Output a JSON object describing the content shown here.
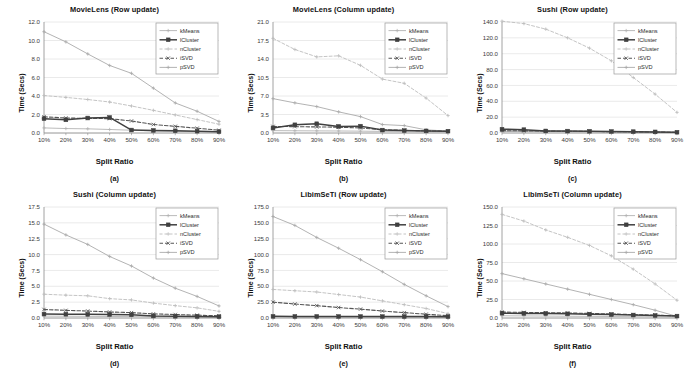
{
  "figure": {
    "ylabel": "Time (Secs)",
    "xlabel": "Split Ratio",
    "categories": [
      "10%",
      "20%",
      "30%",
      "40%",
      "50%",
      "60%",
      "70%",
      "80%",
      "90%"
    ],
    "series_names": [
      "kMeans",
      "lCluster",
      "nCluster",
      "iSVD",
      "pSVD"
    ],
    "colors": {
      "kMeans": "#b3b3b3",
      "lCluster": "#404040",
      "nCluster": "#bdbdbd",
      "iSVD": "#555555",
      "pSVD": "#aaaaaa",
      "grid": "#d9d9d9",
      "axis": "#8c8c8c"
    }
  },
  "chart_data": [
    {
      "type": "line",
      "panel": "a",
      "title": "MovieLens (Row update)",
      "caption": "(a)",
      "xlabel": "Split Ratio",
      "ylabel": "Time (Secs)",
      "categories": [
        "10%",
        "20%",
        "30%",
        "40%",
        "50%",
        "60%",
        "70%",
        "80%",
        "90%"
      ],
      "yticks": [
        0.0,
        2.0,
        4.0,
        6.0,
        8.0,
        10.0,
        12.0
      ],
      "ytick_labels": [
        "0.0",
        "2.0",
        "4.0",
        "6.0",
        "8.0",
        "10.0",
        "12.0"
      ],
      "ylim": [
        0.0,
        12.0
      ],
      "grid": true,
      "legend_position": "top-right",
      "series": [
        {
          "name": "kMeans",
          "values": [
            0.55,
            0.48,
            0.45,
            0.38,
            0.3,
            0.22,
            0.18,
            0.14,
            0.1
          ]
        },
        {
          "name": "lCluster",
          "values": [
            1.55,
            1.42,
            1.62,
            1.68,
            0.32,
            0.28,
            0.24,
            0.2,
            0.14
          ]
        },
        {
          "name": "nCluster",
          "values": [
            4.05,
            3.85,
            3.62,
            3.35,
            2.92,
            2.45,
            1.95,
            1.45,
            0.95
          ]
        },
        {
          "name": "iSVD",
          "values": [
            1.75,
            1.62,
            1.58,
            1.55,
            1.3,
            0.92,
            0.72,
            0.52,
            0.3
          ]
        },
        {
          "name": "pSVD",
          "values": [
            10.95,
            9.85,
            8.55,
            7.3,
            6.45,
            4.85,
            3.25,
            2.35,
            1.25
          ]
        }
      ]
    },
    {
      "type": "line",
      "panel": "b",
      "title": "MovieLens (Column update)",
      "caption": "(b)",
      "xlabel": "Split Ratio",
      "ylabel": "Time (Secs)",
      "categories": [
        "10%",
        "20%",
        "30%",
        "40%",
        "50%",
        "60%",
        "70%",
        "80%",
        "90%"
      ],
      "yticks": [
        0.0,
        3.5,
        7.0,
        10.5,
        14.0,
        17.5,
        21.0
      ],
      "ytick_labels": [
        "0.0",
        "3.5",
        "7.0",
        "10.5",
        "14.0",
        "17.5",
        "21.0"
      ],
      "ylim": [
        0.0,
        21.0
      ],
      "grid": true,
      "legend_position": "top-right",
      "series": [
        {
          "name": "kMeans",
          "values": [
            0.45,
            0.42,
            0.4,
            0.38,
            0.35,
            0.3,
            0.26,
            0.2,
            0.15
          ]
        },
        {
          "name": "lCluster",
          "values": [
            0.95,
            1.55,
            1.75,
            1.25,
            1.3,
            0.55,
            0.45,
            0.4,
            0.35
          ]
        },
        {
          "name": "nCluster",
          "values": [
            17.9,
            15.8,
            14.4,
            14.6,
            12.8,
            10.2,
            9.4,
            6.6,
            3.3
          ]
        },
        {
          "name": "iSVD",
          "values": [
            1.25,
            1.2,
            1.15,
            1.1,
            0.95,
            0.62,
            0.5,
            0.42,
            0.32
          ]
        },
        {
          "name": "pSVD",
          "values": [
            6.5,
            5.7,
            5.0,
            4.0,
            3.1,
            1.6,
            1.4,
            0.6,
            0.35
          ]
        }
      ]
    },
    {
      "type": "line",
      "panel": "c",
      "title": "Sushi (Row update)",
      "caption": "(c)",
      "xlabel": "Split Ratio",
      "ylabel": "Time (Secs)",
      "categories": [
        "10%",
        "20%",
        "30%",
        "40%",
        "50%",
        "60%",
        "70%",
        "80%",
        "90%"
      ],
      "yticks": [
        0.0,
        20.0,
        40.0,
        60.0,
        80.0,
        100.0,
        120.0,
        140.0
      ],
      "ytick_labels": [
        "0.0",
        "20.0",
        "40.0",
        "60.0",
        "80.0",
        "100.0",
        "120.0",
        "140.0"
      ],
      "ylim": [
        0.0,
        140.0
      ],
      "grid": true,
      "legend_position": "top-right",
      "series": [
        {
          "name": "kMeans",
          "values": [
            2.0,
            1.8,
            1.6,
            1.4,
            1.2,
            1.0,
            0.9,
            0.7,
            0.5
          ]
        },
        {
          "name": "lCluster",
          "values": [
            4.8,
            4.2,
            2.6,
            2.4,
            2.2,
            1.9,
            1.7,
            1.4,
            1.0
          ]
        },
        {
          "name": "nCluster",
          "values": [
            141.0,
            138.0,
            131.0,
            120.0,
            107.0,
            91.0,
            70.0,
            49.0,
            26.0
          ]
        },
        {
          "name": "iSVD",
          "values": [
            3.0,
            2.7,
            2.4,
            2.2,
            2.0,
            1.7,
            1.5,
            1.2,
            0.9
          ]
        },
        {
          "name": "pSVD",
          "values": [
            2.5,
            2.2,
            2.0,
            1.8,
            1.6,
            1.4,
            1.2,
            1.0,
            0.7
          ]
        }
      ]
    },
    {
      "type": "line",
      "panel": "d",
      "title": "Sushi (Column update)",
      "caption": "(d)",
      "xlabel": "Split Ratio",
      "ylabel": "Time (Secs)",
      "categories": [
        "10%",
        "20%",
        "30%",
        "40%",
        "50%",
        "60%",
        "70%",
        "80%",
        "90%"
      ],
      "yticks": [
        0.0,
        2.5,
        5.0,
        7.5,
        10.0,
        12.5,
        15.0,
        17.5
      ],
      "ytick_labels": [
        "0.0",
        "2.5",
        "5.0",
        "7.5",
        "10.0",
        "12.5",
        "15.0",
        "17.5"
      ],
      "ylim": [
        0.0,
        17.5
      ],
      "grid": true,
      "legend_position": "top-right",
      "series": [
        {
          "name": "kMeans",
          "values": [
            0.3,
            0.28,
            0.26,
            0.24,
            0.22,
            0.18,
            0.15,
            0.12,
            0.1
          ]
        },
        {
          "name": "lCluster",
          "values": [
            0.62,
            0.6,
            0.58,
            0.55,
            0.5,
            0.32,
            0.28,
            0.24,
            0.2
          ]
        },
        {
          "name": "nCluster",
          "values": [
            3.75,
            3.6,
            3.5,
            3.05,
            2.85,
            2.35,
            1.95,
            1.6,
            1.05
          ]
        },
        {
          "name": "iSVD",
          "values": [
            1.35,
            1.2,
            1.1,
            0.95,
            0.85,
            0.65,
            0.55,
            0.45,
            0.35
          ]
        },
        {
          "name": "pSVD",
          "values": [
            14.8,
            13.1,
            11.6,
            9.7,
            8.2,
            6.3,
            4.7,
            3.4,
            1.9
          ]
        }
      ]
    },
    {
      "type": "line",
      "panel": "e",
      "title": "LibimSeTi (Row update)",
      "caption": "(e)",
      "xlabel": "Split Ratio",
      "ylabel": "Time (Secs)",
      "categories": [
        "10%",
        "20%",
        "30%",
        "40%",
        "50%",
        "60%",
        "70%",
        "80%",
        "90%"
      ],
      "yticks": [
        0.0,
        25.0,
        50.0,
        75.0,
        100.0,
        125.0,
        150.0,
        175.0
      ],
      "ytick_labels": [
        "0.0",
        "25.0",
        "50.0",
        "75.0",
        "100.0",
        "125.0",
        "150.0",
        "175.0"
      ],
      "ylim": [
        0.0,
        175.0
      ],
      "grid": true,
      "legend_position": "top-right",
      "series": [
        {
          "name": "kMeans",
          "values": [
            1.5,
            1.4,
            1.3,
            1.2,
            1.1,
            1.0,
            0.9,
            0.8,
            0.6
          ]
        },
        {
          "name": "lCluster",
          "values": [
            2.6,
            2.5,
            2.5,
            2.4,
            2.4,
            2.3,
            2.3,
            2.2,
            2.1
          ]
        },
        {
          "name": "nCluster",
          "values": [
            45.0,
            43.0,
            41.0,
            37.0,
            33.0,
            27.0,
            21.0,
            15.0,
            7.0
          ]
        },
        {
          "name": "iSVD",
          "values": [
            25.0,
            22.0,
            19.5,
            16.5,
            14.0,
            11.0,
            8.5,
            6.0,
            3.5
          ]
        },
        {
          "name": "pSVD",
          "values": [
            160.0,
            146.0,
            127.0,
            110.0,
            92.0,
            73.0,
            53.0,
            35.0,
            18.0
          ]
        }
      ]
    },
    {
      "type": "line",
      "panel": "f",
      "title": "LibimSeTi (Column update)",
      "caption": "(f)",
      "xlabel": "Split Ratio",
      "ylabel": "Time (Secs)",
      "categories": [
        "10%",
        "20%",
        "30%",
        "40%",
        "50%",
        "60%",
        "70%",
        "80%",
        "90%"
      ],
      "yticks": [
        0.0,
        25.0,
        50.0,
        75.0,
        100.0,
        125.0,
        150.0
      ],
      "ytick_labels": [
        "0.0",
        "25.0",
        "50.0",
        "75.0",
        "100.0",
        "125.0",
        "150.0"
      ],
      "ylim": [
        0.0,
        150.0
      ],
      "grid": true,
      "legend_position": "top-right",
      "series": [
        {
          "name": "kMeans",
          "values": [
            3.0,
            2.8,
            2.6,
            2.4,
            2.2,
            2.0,
            1.8,
            1.5,
            1.2
          ]
        },
        {
          "name": "lCluster",
          "values": [
            6.5,
            6.2,
            6.0,
            5.6,
            5.2,
            4.6,
            4.0,
            3.4,
            2.6
          ]
        },
        {
          "name": "nCluster",
          "values": [
            140.0,
            131.0,
            119.0,
            109.0,
            98.0,
            84.0,
            66.0,
            46.0,
            24.0
          ]
        },
        {
          "name": "iSVD",
          "values": [
            8.0,
            7.6,
            7.2,
            6.8,
            6.2,
            5.4,
            4.6,
            3.8,
            2.9
          ]
        },
        {
          "name": "pSVD",
          "values": [
            60.0,
            53.0,
            46.0,
            39.0,
            32.0,
            25.0,
            18.0,
            10.5,
            2.2
          ]
        }
      ]
    }
  ]
}
